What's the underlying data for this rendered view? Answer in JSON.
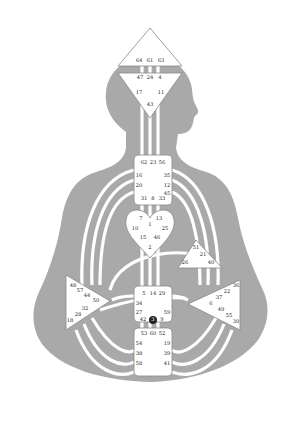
{
  "colors": {
    "background": "#ffffff",
    "body": "#a9a9a9",
    "center_fill": "#ffffff",
    "center_stroke": "#888888",
    "text": "#222222",
    "marker": "#222222"
  },
  "centers": {
    "head": {
      "gates": [
        "64",
        "61",
        "63"
      ]
    },
    "ajna": {
      "gates": [
        "47",
        "24",
        "4",
        "17",
        "11",
        "43"
      ]
    },
    "throat": {
      "gates": [
        "62",
        "23",
        "56",
        "16",
        "35",
        "20",
        "12",
        "45",
        "31",
        "8",
        "33"
      ]
    },
    "g": {
      "gates": [
        "7",
        "1",
        "13",
        "10",
        "25",
        "15",
        "46",
        "2"
      ]
    },
    "ego": {
      "gates": [
        "51",
        "21",
        "26",
        "40"
      ]
    },
    "spleen": {
      "gates": [
        "48",
        "57",
        "44",
        "50",
        "32",
        "28",
        "18"
      ]
    },
    "solar_plexus": {
      "gates": [
        "36",
        "22",
        "37",
        "6",
        "49",
        "55",
        "30"
      ]
    },
    "sacral": {
      "gates": [
        "5",
        "14",
        "29",
        "34",
        "27",
        "59",
        "42",
        "3",
        "9"
      ]
    },
    "root": {
      "gates": [
        "53",
        "60",
        "52",
        "54",
        "19",
        "38",
        "39",
        "58",
        "41"
      ]
    }
  },
  "marker": {
    "label": "3",
    "center": "sacral"
  }
}
